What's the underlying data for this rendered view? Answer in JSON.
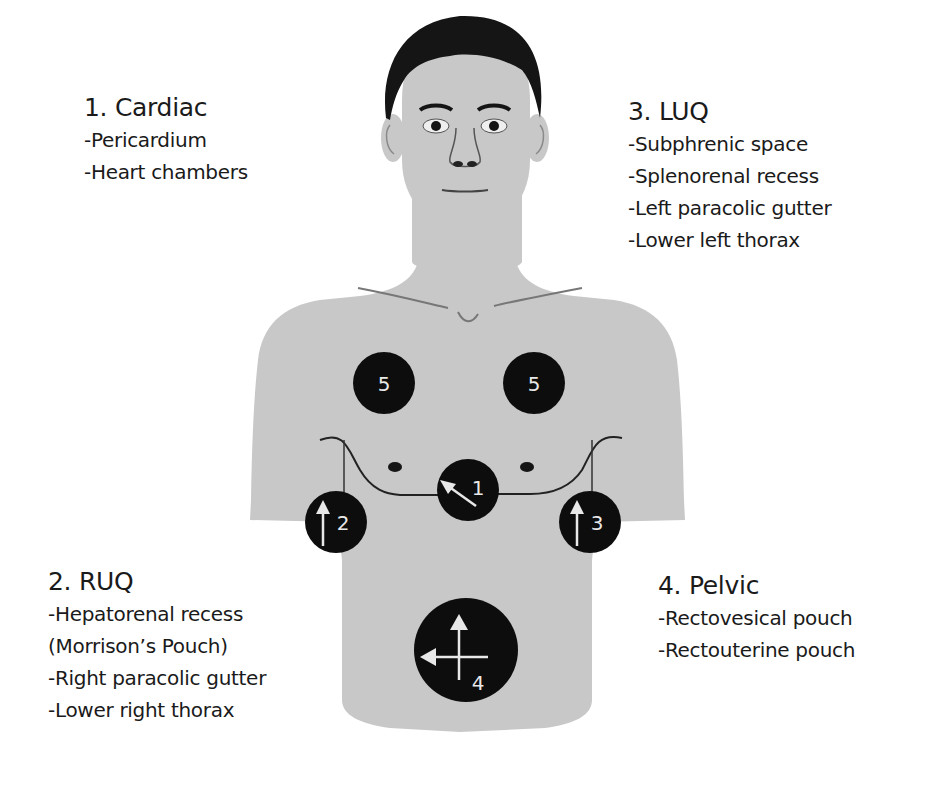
{
  "diagram": {
    "type": "FAST exam probe positions on torso",
    "colors": {
      "background": "#ffffff",
      "skin": "#c8c8c8",
      "hair": "#151515",
      "probe_circle": "#0d0d0d",
      "probe_marker": "#e8e8e8",
      "text": "#1a1a1a"
    },
    "regions": [
      {
        "title": "1. Cardiac",
        "items": [
          "-Pericardium",
          "-Heart chambers"
        ]
      },
      {
        "title": "2. RUQ",
        "items": [
          "-Hepatorenal recess",
          "(Morrison’s Pouch)",
          "-Right paracolic gutter",
          "-Lower right thorax"
        ]
      },
      {
        "title": "3. LUQ",
        "items": [
          "-Subphrenic space",
          "-Splenorenal recess",
          "-Left paracolic gutter",
          "-Lower left thorax"
        ]
      },
      {
        "title": "4. Pelvic",
        "items": [
          "-Rectovesical pouch",
          "-Rectouterine pouch"
        ]
      }
    ],
    "probes": [
      {
        "id": "5a",
        "number": "5",
        "position": "right-upper-chest",
        "arrow": "none"
      },
      {
        "id": "5b",
        "number": "5",
        "position": "left-upper-chest",
        "arrow": "none"
      },
      {
        "id": "1",
        "number": "1",
        "position": "subxiphoid",
        "arrow": "up-left"
      },
      {
        "id": "2",
        "number": "2",
        "position": "right-flank",
        "arrow": "up"
      },
      {
        "id": "3",
        "number": "3",
        "position": "left-flank",
        "arrow": "up"
      },
      {
        "id": "4",
        "number": "4",
        "position": "suprapubic",
        "arrow": "up-and-left-cross"
      }
    ]
  }
}
